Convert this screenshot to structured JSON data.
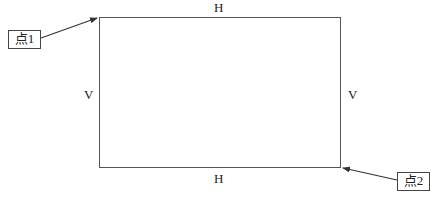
{
  "diagram": {
    "type": "rectangle-with-labeled-corners",
    "rectangle": {
      "top_edge_label": "H",
      "bottom_edge_label": "H",
      "left_edge_label": "V",
      "right_edge_label": "V",
      "stroke_color": "#555555"
    },
    "points": [
      {
        "label": "点1",
        "target_corner": "top-left"
      },
      {
        "label": "点2",
        "target_corner": "bottom-right"
      }
    ],
    "arrow_color": "#333333"
  }
}
